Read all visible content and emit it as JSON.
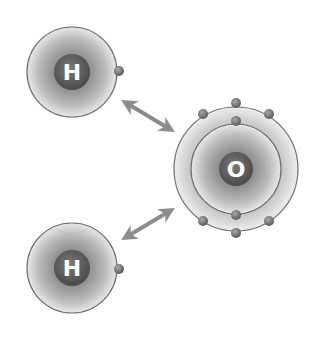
{
  "diagram": {
    "type": "water-molecule-bonding",
    "atoms": [
      {
        "id": "hydrogen-top",
        "symbol": "H",
        "cx": 72,
        "cy": 72,
        "shell_radii": [
          45
        ],
        "electrons": [
          [
            119,
            71
          ]
        ]
      },
      {
        "id": "hydrogen-bottom",
        "symbol": "H",
        "cx": 72,
        "cy": 268,
        "shell_radii": [
          45
        ],
        "electrons": [
          [
            119,
            269
          ]
        ]
      },
      {
        "id": "oxygen",
        "symbol": "O",
        "cx": 236,
        "cy": 169,
        "shell_radii": [
          45,
          62
        ],
        "electrons": [
          [
            236,
            103
          ],
          [
            203,
            114
          ],
          [
            269,
            114
          ],
          [
            236,
            121
          ],
          [
            236,
            215
          ],
          [
            203,
            221
          ],
          [
            269,
            221
          ],
          [
            236,
            233
          ]
        ]
      }
    ],
    "arrows": [
      {
        "id": "arrow-top",
        "from": [
          124,
          102
        ],
        "to": [
          172,
          131
        ],
        "bidirectional": true
      },
      {
        "id": "arrow-bottom",
        "from": [
          124,
          238
        ],
        "to": [
          172,
          209
        ],
        "bidirectional": true
      }
    ],
    "colors": {
      "shell_line": "#6f6f6f",
      "electron": "#7a7a7a",
      "arrow": "#8c8c8c",
      "nucleus": "#5e5e5e"
    }
  }
}
